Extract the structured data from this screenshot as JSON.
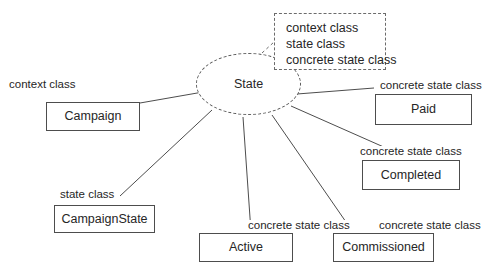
{
  "diagram": {
    "stroke_color": "#4d4d4d",
    "text_color": "#262626",
    "background": "#ffffff"
  },
  "legend": {
    "name": "stereotype-legend",
    "lines": [
      "context class",
      "state class",
      "concrete state class"
    ]
  },
  "central_node": {
    "label": "State",
    "shape": "ellipse",
    "border_style": "dashed"
  },
  "nodes": [
    {
      "id": "campaign",
      "label": "Campaign"
    },
    {
      "id": "campaign-state",
      "label": "CampaignState"
    },
    {
      "id": "active",
      "label": "Active"
    },
    {
      "id": "commissioned",
      "label": "Commissioned"
    },
    {
      "id": "completed",
      "label": "Completed"
    },
    {
      "id": "paid",
      "label": "Paid"
    }
  ],
  "edge_labels": [
    {
      "id": "campaign",
      "text": "context class"
    },
    {
      "id": "campaign-state",
      "text": "state class"
    },
    {
      "id": "active",
      "text": "concrete state class"
    },
    {
      "id": "commissioned",
      "text": "concrete state class"
    },
    {
      "id": "completed",
      "text": "concrete state class"
    },
    {
      "id": "paid",
      "text": "concrete state class"
    }
  ]
}
